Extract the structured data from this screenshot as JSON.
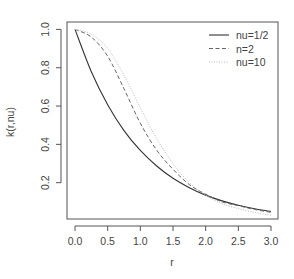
{
  "chart_data": {
    "type": "line",
    "title": "",
    "xlabel": "r",
    "ylabel": "k(r,nu)",
    "xlim": [
      0,
      3
    ],
    "ylim": [
      0.03,
      1.0
    ],
    "grid": false,
    "legend_position": "top-right",
    "x_ticks": [
      "0.0",
      "0.5",
      "1.0",
      "1.5",
      "2.0",
      "2.5",
      "3.0"
    ],
    "y_ticks": [
      "0.2",
      "0.4",
      "0.6",
      "0.8",
      "1.0"
    ],
    "x": [
      0,
      0.25,
      0.5,
      0.75,
      1.0,
      1.25,
      1.5,
      1.75,
      2.0,
      2.25,
      2.5,
      2.75,
      3.0
    ],
    "series": [
      {
        "name": "nu=1/2",
        "style": "solid",
        "color": "#333333",
        "values": [
          1.0,
          0.779,
          0.607,
          0.472,
          0.368,
          0.287,
          0.223,
          0.174,
          0.135,
          0.105,
          0.082,
          0.064,
          0.05
        ]
      },
      {
        "name": "n=2",
        "style": "dashed",
        "color": "#666666",
        "values": [
          1.0,
          0.96,
          0.86,
          0.69,
          0.51,
          0.37,
          0.27,
          0.19,
          0.14,
          0.1,
          0.08,
          0.06,
          0.045
        ]
      },
      {
        "name": "nu=10",
        "style": "dotted",
        "color": "#bbbbbb",
        "values": [
          1.0,
          0.975,
          0.9,
          0.76,
          0.59,
          0.43,
          0.3,
          0.2,
          0.135,
          0.09,
          0.065,
          0.045,
          0.03
        ]
      }
    ]
  }
}
